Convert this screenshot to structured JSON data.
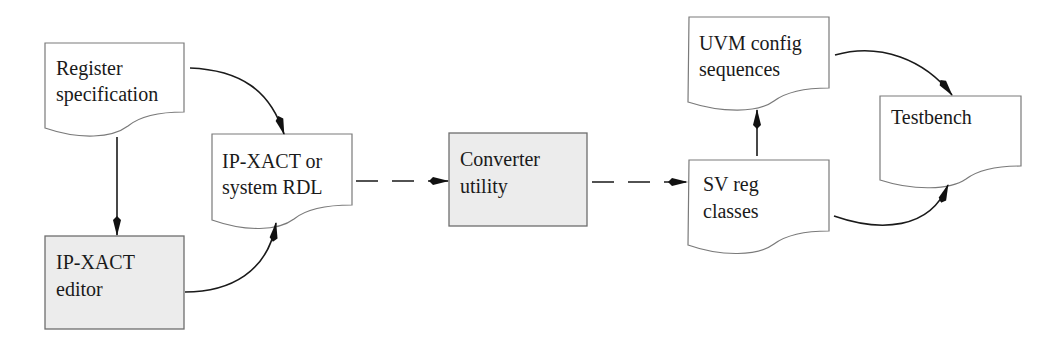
{
  "diagram": {
    "nodes": [
      {
        "id": "register_spec",
        "shape": "document",
        "lines": [
          "Register",
          "specification"
        ]
      },
      {
        "id": "ipxact_editor",
        "shape": "process",
        "lines": [
          "IP-XACT",
          "editor"
        ]
      },
      {
        "id": "ipxact_rdl",
        "shape": "document",
        "lines": [
          "IP-XACT or",
          "system RDL"
        ]
      },
      {
        "id": "converter",
        "shape": "process",
        "lines": [
          "Converter",
          "utility"
        ]
      },
      {
        "id": "sv_reg",
        "shape": "document",
        "lines": [
          "SV reg",
          "classes"
        ]
      },
      {
        "id": "uvm_config",
        "shape": "document",
        "lines": [
          "UVM config",
          "sequences"
        ]
      },
      {
        "id": "testbench",
        "shape": "document",
        "lines": [
          "Testbench"
        ]
      }
    ],
    "edges": [
      {
        "from": "register_spec",
        "to": "ipxact_rdl",
        "style": "solid"
      },
      {
        "from": "register_spec",
        "to": "ipxact_editor",
        "style": "solid"
      },
      {
        "from": "ipxact_editor",
        "to": "ipxact_rdl",
        "style": "solid"
      },
      {
        "from": "ipxact_rdl",
        "to": "converter",
        "style": "dashed"
      },
      {
        "from": "converter",
        "to": "sv_reg",
        "style": "dashed"
      },
      {
        "from": "sv_reg",
        "to": "uvm_config",
        "style": "solid"
      },
      {
        "from": "uvm_config",
        "to": "testbench",
        "style": "solid"
      },
      {
        "from": "sv_reg",
        "to": "testbench",
        "style": "solid"
      }
    ]
  },
  "colors": {
    "process_fill": "#ececec",
    "document_fill": "#ffffff",
    "stroke": "#1a1a1a"
  }
}
